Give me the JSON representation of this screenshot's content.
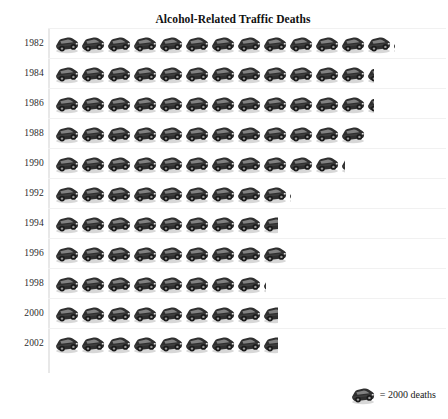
{
  "chart_data": {
    "type": "bar",
    "subtype": "pictogram",
    "title": "Alcohol-Related Traffic Deaths",
    "xlabel": "",
    "ylabel": "",
    "unit_label": "= 2000 deaths",
    "unit_value": 2000,
    "icon": "car-icon",
    "grid": false,
    "legend_position": "bottom-right",
    "categories": [
      "1982",
      "1984",
      "1986",
      "1988",
      "1990",
      "1992",
      "1994",
      "1996",
      "1998",
      "2000",
      "2002"
    ],
    "icon_counts": [
      13.1,
      12.3,
      12.3,
      12.0,
      11.2,
      9.1,
      8.6,
      9.0,
      8.15,
      8.6,
      8.6
    ],
    "values": [
      26200,
      24600,
      24600,
      24000,
      22400,
      18200,
      17200,
      18000,
      16300,
      17200,
      17200
    ],
    "colors": {
      "icon": "#2b2b2b",
      "icon_shadow": "#bdbdbd",
      "row_separator": "#f1f1f1",
      "axis": "#e8e8e8",
      "text": "#1a1a1a"
    }
  },
  "legend": {
    "text": "= 2000 deaths"
  }
}
